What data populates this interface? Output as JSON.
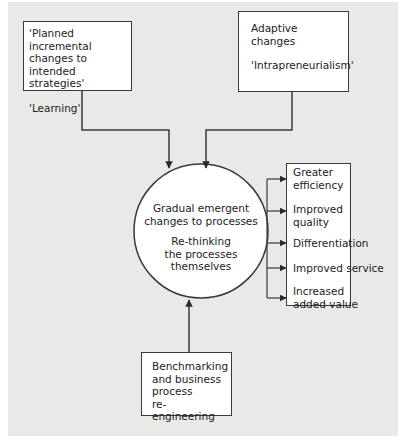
{
  "diagram": {
    "top_left_box": {
      "lines": [
        "'Planned incremental",
        "changes to intended",
        "strategies'"
      ],
      "second": "'Learning'"
    },
    "top_right_box": {
      "lines": [
        "Adaptive",
        "changes"
      ],
      "second": "'Intrapreneurialism'"
    },
    "center_circle": {
      "first": [
        "Gradual emergent",
        "changes to processes"
      ],
      "second": [
        "Re-thinking",
        "the processes",
        "themselves"
      ]
    },
    "outcomes_box": {
      "items": [
        {
          "lines": [
            "Greater",
            "efficiency"
          ]
        },
        {
          "lines": [
            "Improved",
            "quality"
          ]
        },
        {
          "lines": [
            "Differentiation"
          ]
        },
        {
          "lines": [
            "Improved service"
          ]
        },
        {
          "lines": [
            "Increased",
            "added value"
          ]
        }
      ]
    },
    "bottom_box": {
      "lines": [
        "Benchmarking",
        "and business",
        "process",
        "re-engineering"
      ]
    },
    "colors": {
      "panel_background": "#e9e9e7",
      "box_fill": "#ffffff",
      "line": "#3a3a3a"
    }
  }
}
